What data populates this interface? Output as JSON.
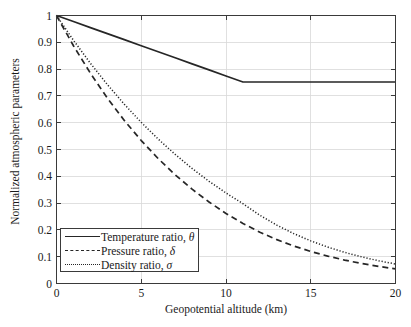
{
  "chart_data": {
    "type": "line",
    "title": "",
    "xlabel": "Geopotential altitude (km)",
    "ylabel": "Normalized atmospheric parameters",
    "xlim": [
      0,
      20
    ],
    "ylim": [
      0,
      1
    ],
    "xticks": [
      "0",
      "5",
      "10",
      "15",
      "20"
    ],
    "xtick_values": [
      0,
      5,
      10,
      15,
      20
    ],
    "yticks": [
      "0",
      "0.1",
      "0.2",
      "0.3",
      "0.4",
      "0.5",
      "0.6",
      "0.7",
      "0.8",
      "0.9",
      "1"
    ],
    "ytick_values": [
      0,
      0.1,
      0.2,
      0.3,
      0.4,
      0.5,
      0.6,
      0.7,
      0.8,
      0.9,
      1
    ],
    "grid": true,
    "legend_position": "lower left",
    "x": [
      0,
      1,
      2,
      3,
      4,
      5,
      6,
      7,
      8,
      9,
      10,
      11,
      12,
      13,
      14,
      15,
      16,
      17,
      18,
      19,
      20
    ],
    "series": [
      {
        "name": "Temperature ratio, θ",
        "symbol": "θ",
        "label_prefix": "Temperature ratio, ",
        "style": "solid",
        "color": "#262626",
        "values": [
          1.0,
          0.9774,
          0.9549,
          0.9323,
          0.9098,
          0.8872,
          0.8647,
          0.8421,
          0.8196,
          0.797,
          0.7744,
          0.7519,
          0.7519,
          0.7519,
          0.7519,
          0.7519,
          0.7519,
          0.7519,
          0.7519,
          0.7519,
          0.7519
        ]
      },
      {
        "name": "Pressure ratio, δ",
        "symbol": "δ",
        "label_prefix": "Pressure ratio, ",
        "style": "dashed",
        "color": "#262626",
        "values": [
          1.0,
          0.887,
          0.7846,
          0.692,
          0.6085,
          0.5334,
          0.466,
          0.4057,
          0.3519,
          0.304,
          0.2615,
          0.224,
          0.1915,
          0.1636,
          0.1399,
          0.1195,
          0.1022,
          0.0873,
          0.0747,
          0.0638,
          0.0546
        ]
      },
      {
        "name": "Density ratio, σ",
        "symbol": "σ",
        "label_prefix": "Density ratio, ",
        "style": "dotted",
        "color": "#262626",
        "values": [
          1.0,
          0.9075,
          0.8217,
          0.7423,
          0.6689,
          0.6012,
          0.5389,
          0.4817,
          0.4292,
          0.3813,
          0.3376,
          0.2978,
          0.2546,
          0.2176,
          0.186,
          0.159,
          0.1359,
          0.1162,
          0.0993,
          0.0849,
          0.0726
        ]
      }
    ]
  },
  "axes": {
    "background": "#ffffff",
    "frame_color": "#3a3a3a",
    "grid_color": "#d8d8d8"
  }
}
